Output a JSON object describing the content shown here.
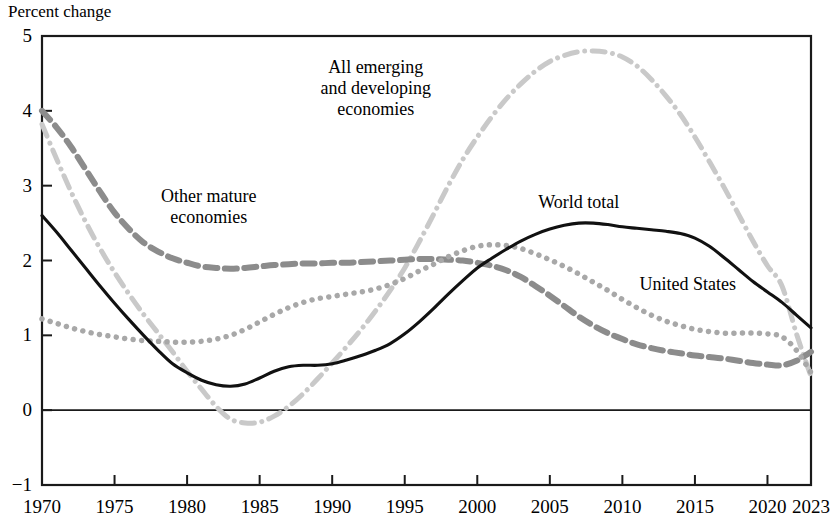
{
  "chart_data": {
    "type": "line",
    "title": "",
    "ylabel": "Percent change",
    "xlabel": "",
    "xlim": [
      1970,
      2023
    ],
    "ylim": [
      -1,
      5
    ],
    "grid": false,
    "zero_line": true,
    "legend_position": "inline-annotations",
    "x_ticks": [
      "1970",
      "1975",
      "1980",
      "1985",
      "1990",
      "1995",
      "2000",
      "2005",
      "2010",
      "2015",
      "2020",
      "2023"
    ],
    "y_ticks": [
      "5",
      "4",
      "3",
      "2",
      "1",
      "0",
      "-1"
    ],
    "x": [
      1970,
      1971,
      1972,
      1973,
      1974,
      1975,
      1976,
      1977,
      1978,
      1979,
      1980,
      1981,
      1982,
      1983,
      1984,
      1985,
      1986,
      1987,
      1988,
      1989,
      1990,
      1991,
      1992,
      1993,
      1994,
      1995,
      1996,
      1997,
      1998,
      1999,
      2000,
      2001,
      2002,
      2003,
      2004,
      2005,
      2006,
      2007,
      2008,
      2009,
      2010,
      2011,
      2012,
      2013,
      2014,
      2015,
      2016,
      2017,
      2018,
      2019,
      2020,
      2021,
      2022,
      2023
    ],
    "series": [
      {
        "name": "World total",
        "style": "solid",
        "color": "#111111",
        "width": 3.1,
        "label_x": 2007,
        "label_y": 2.78,
        "values": [
          2.6,
          2.38,
          2.14,
          1.9,
          1.66,
          1.43,
          1.21,
          1.0,
          0.8,
          0.62,
          0.5,
          0.4,
          0.34,
          0.32,
          0.35,
          0.43,
          0.52,
          0.58,
          0.6,
          0.6,
          0.62,
          0.67,
          0.73,
          0.8,
          0.89,
          1.02,
          1.18,
          1.36,
          1.55,
          1.73,
          1.9,
          2.03,
          2.15,
          2.26,
          2.35,
          2.42,
          2.47,
          2.5,
          2.5,
          2.48,
          2.45,
          2.43,
          2.41,
          2.39,
          2.36,
          2.3,
          2.19,
          2.04,
          1.88,
          1.72,
          1.58,
          1.44,
          1.27,
          1.1
        ]
      },
      {
        "name": "Other mature economies",
        "style": "dashed",
        "color": "#8c8c8c",
        "width": 6.0,
        "label_x": 1981.5,
        "label_y": 2.72,
        "values": [
          4.0,
          3.78,
          3.52,
          3.22,
          2.92,
          2.64,
          2.42,
          2.24,
          2.12,
          2.03,
          1.97,
          1.92,
          1.9,
          1.89,
          1.9,
          1.92,
          1.94,
          1.95,
          1.96,
          1.96,
          1.97,
          1.97,
          1.98,
          1.99,
          2.0,
          2.01,
          2.02,
          2.02,
          2.01,
          2.0,
          1.97,
          1.93,
          1.87,
          1.78,
          1.66,
          1.53,
          1.39,
          1.25,
          1.13,
          1.03,
          0.95,
          0.88,
          0.83,
          0.79,
          0.76,
          0.73,
          0.71,
          0.69,
          0.66,
          0.63,
          0.61,
          0.6,
          0.66,
          0.78
        ]
      },
      {
        "name": "United States",
        "style": "dotted",
        "color": "#a8a8a8",
        "width": 5.5,
        "label_x": 2014.5,
        "label_y": 1.68,
        "values": [
          1.22,
          1.16,
          1.1,
          1.05,
          1.01,
          0.98,
          0.95,
          0.93,
          0.92,
          0.91,
          0.91,
          0.92,
          0.95,
          1.0,
          1.08,
          1.18,
          1.28,
          1.37,
          1.44,
          1.49,
          1.52,
          1.55,
          1.58,
          1.62,
          1.68,
          1.76,
          1.86,
          1.95,
          2.05,
          2.13,
          2.19,
          2.21,
          2.2,
          2.16,
          2.09,
          2.01,
          1.92,
          1.82,
          1.71,
          1.6,
          1.48,
          1.37,
          1.27,
          1.19,
          1.13,
          1.08,
          1.05,
          1.03,
          1.03,
          1.03,
          1.02,
          0.98,
          0.8,
          0.5
        ]
      },
      {
        "name": "All emerging and developing economies",
        "style": "dash-dot",
        "color": "#c9c9c9",
        "width": 5.0,
        "label_x": 1993,
        "label_y": 4.3,
        "values": [
          3.82,
          3.36,
          2.92,
          2.52,
          2.16,
          1.84,
          1.55,
          1.28,
          1.03,
          0.78,
          0.52,
          0.28,
          0.05,
          -0.12,
          -0.17,
          -0.16,
          -0.08,
          0.05,
          0.22,
          0.42,
          0.63,
          0.85,
          1.08,
          1.33,
          1.6,
          1.9,
          2.25,
          2.62,
          3.0,
          3.35,
          3.65,
          3.92,
          4.16,
          4.36,
          4.53,
          4.66,
          4.74,
          4.79,
          4.8,
          4.78,
          4.72,
          4.6,
          4.42,
          4.2,
          3.95,
          3.65,
          3.32,
          2.98,
          2.62,
          2.26,
          1.93,
          1.66,
          1.02,
          0.45
        ]
      }
    ]
  },
  "annotations": {
    "world_total": {
      "lines": [
        "World total"
      ]
    },
    "other_mature": {
      "lines": [
        "Other mature",
        "economies"
      ]
    },
    "united_states": {
      "lines": [
        "United States"
      ]
    },
    "emerging": {
      "lines": [
        "All emerging",
        "and developing",
        "economies"
      ]
    }
  }
}
